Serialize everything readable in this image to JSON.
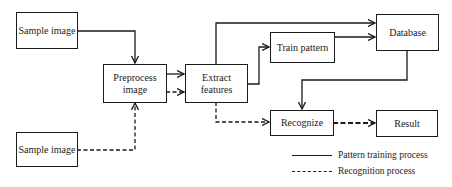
{
  "diagram": {
    "type": "flowchart",
    "nodes": [
      {
        "id": "sample1",
        "label": "Sample image"
      },
      {
        "id": "preprocess",
        "label": "Preprocess image"
      },
      {
        "id": "extract",
        "label": "Extract features"
      },
      {
        "id": "train",
        "label": "Train pattern"
      },
      {
        "id": "database",
        "label": "Database"
      },
      {
        "id": "recognize",
        "label": "Recognize"
      },
      {
        "id": "result",
        "label": "Result"
      },
      {
        "id": "sample2",
        "label": "Sample image"
      }
    ],
    "edges": [
      {
        "from": "sample1",
        "to": "preprocess",
        "style": "solid"
      },
      {
        "from": "preprocess",
        "to": "extract",
        "style": "solid"
      },
      {
        "from": "preprocess",
        "to": "extract",
        "style": "dashed"
      },
      {
        "from": "extract",
        "to": "database",
        "style": "solid"
      },
      {
        "from": "extract",
        "to": "train",
        "style": "solid"
      },
      {
        "from": "train",
        "to": "database",
        "style": "solid"
      },
      {
        "from": "database",
        "to": "recognize",
        "style": "solid"
      },
      {
        "from": "sample2",
        "to": "preprocess",
        "style": "dashed"
      },
      {
        "from": "extract",
        "to": "recognize",
        "style": "dashed"
      },
      {
        "from": "recognize",
        "to": "result",
        "style": "dashed"
      }
    ]
  },
  "labels": {
    "sample1": "Sample image",
    "preprocess_l1": "Preprocess",
    "preprocess_l2": "image",
    "extract_l1": "Extract",
    "extract_l2": "features",
    "train": "Train pattern",
    "database": "Database",
    "recognize": "Recognize",
    "result": "Result",
    "sample2": "Sample image"
  },
  "legend": {
    "items": [
      {
        "style": "solid",
        "label": "Pattern training process"
      },
      {
        "style": "dashed",
        "label": "Recognition process"
      }
    ]
  }
}
